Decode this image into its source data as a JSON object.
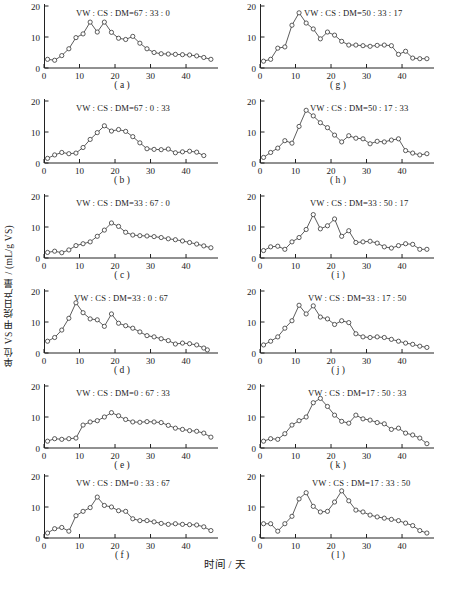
{
  "figure": {
    "ylabel": "单位 VS 甲烷日产量 / (mL/g VS)",
    "xlabel": "时间 / 天"
  },
  "chart_data": [
    {
      "type": "line",
      "panel": "a",
      "caption": "( a )",
      "title": "VW : CS : DM=67 : 33 : 0",
      "xlabel": "",
      "ylabel": "",
      "xlim": [
        0,
        49
      ],
      "ylim": [
        0,
        20
      ],
      "xticks": [
        0,
        10,
        20,
        30,
        40
      ],
      "yticks": [
        0,
        10,
        20
      ],
      "grid": false,
      "x": [
        1,
        3,
        5,
        7,
        9,
        11,
        13,
        15,
        17,
        19,
        21,
        23,
        25,
        27,
        29,
        31,
        33,
        35,
        37,
        39,
        41,
        43,
        45,
        47
      ],
      "values": [
        2.8,
        2.5,
        4.0,
        6.2,
        9.8,
        11.0,
        14.8,
        11.6,
        14.8,
        11.5,
        9.6,
        9.2,
        10.2,
        8.0,
        6.2,
        5.0,
        4.6,
        4.5,
        4.4,
        4.3,
        4.2,
        3.9,
        3.4,
        2.8
      ]
    },
    {
      "type": "line",
      "panel": "b",
      "caption": "( b )",
      "title": "VW : CS : DM=67 : 0 : 33",
      "xlim": [
        0,
        49
      ],
      "ylim": [
        0,
        20
      ],
      "xticks": [
        0,
        10,
        20,
        30,
        40
      ],
      "yticks": [
        0,
        10,
        20
      ],
      "grid": false,
      "x": [
        1,
        3,
        5,
        7,
        9,
        11,
        13,
        15,
        17,
        19,
        21,
        23,
        25,
        27,
        29,
        31,
        33,
        35,
        37,
        39,
        41,
        43,
        45
      ],
      "values": [
        1.5,
        2.6,
        3.4,
        3.0,
        3.2,
        5.0,
        7.6,
        9.8,
        12.0,
        10.3,
        10.8,
        10.2,
        8.5,
        6.5,
        4.6,
        4.4,
        4.3,
        4.5,
        3.3,
        3.6,
        3.8,
        3.5,
        2.4
      ]
    },
    {
      "type": "line",
      "panel": "c",
      "caption": "( c )",
      "title": "VW : CS : DM=33 : 67 : 0",
      "xlim": [
        0,
        49
      ],
      "ylim": [
        0,
        20
      ],
      "xticks": [
        0,
        10,
        20,
        30,
        40
      ],
      "yticks": [
        0,
        10,
        20
      ],
      "grid": false,
      "x": [
        1,
        3,
        5,
        7,
        9,
        11,
        13,
        15,
        17,
        19,
        21,
        23,
        25,
        27,
        29,
        31,
        33,
        35,
        37,
        39,
        41,
        43,
        45,
        47
      ],
      "values": [
        1.8,
        2.2,
        1.7,
        2.6,
        4.0,
        4.6,
        5.2,
        7.0,
        9.0,
        11.3,
        10.2,
        8.3,
        7.4,
        7.2,
        7.1,
        6.9,
        6.6,
        6.2,
        5.9,
        5.5,
        5.0,
        4.5,
        3.9,
        3.3
      ]
    },
    {
      "type": "line",
      "panel": "d",
      "caption": "( d )",
      "title": "VW : CS : DM=33 : 0 : 67",
      "xlim": [
        0,
        49
      ],
      "ylim": [
        0,
        20
      ],
      "xticks": [
        0,
        10,
        20,
        30,
        40
      ],
      "yticks": [
        0,
        10,
        20
      ],
      "grid": false,
      "x": [
        1,
        3,
        5,
        7,
        9,
        11,
        13,
        15,
        17,
        19,
        21,
        23,
        25,
        27,
        29,
        31,
        33,
        35,
        37,
        39,
        41,
        43,
        45,
        46
      ],
      "values": [
        3.8,
        5.0,
        7.4,
        11.2,
        16.2,
        13.0,
        11.0,
        10.7,
        8.6,
        12.6,
        9.6,
        8.8,
        8.0,
        6.8,
        5.6,
        5.2,
        4.6,
        4.0,
        2.9,
        3.2,
        3.0,
        2.6,
        1.6,
        1.0
      ]
    },
    {
      "type": "line",
      "panel": "e",
      "caption": "( e )",
      "title": "VW : CS : DM=0 : 67 : 33",
      "xlim": [
        0,
        49
      ],
      "ylim": [
        0,
        20
      ],
      "xticks": [
        0,
        10,
        20,
        30,
        40
      ],
      "yticks": [
        0,
        10,
        20
      ],
      "grid": false,
      "x": [
        1,
        3,
        5,
        7,
        9,
        11,
        13,
        15,
        17,
        19,
        21,
        23,
        25,
        27,
        29,
        31,
        33,
        35,
        37,
        39,
        41,
        43,
        45,
        47
      ],
      "values": [
        2.2,
        3.0,
        2.8,
        3.0,
        3.2,
        7.4,
        8.4,
        8.8,
        10.0,
        11.4,
        10.4,
        9.2,
        8.4,
        8.3,
        8.5,
        8.4,
        8.2,
        7.3,
        6.4,
        6.0,
        5.6,
        5.4,
        4.8,
        3.5
      ]
    },
    {
      "type": "line",
      "panel": "f",
      "caption": "( f )",
      "title": "VW : CS : DM=0 : 33 : 67",
      "xlim": [
        0,
        49
      ],
      "ylim": [
        0,
        20
      ],
      "xticks": [
        0,
        10,
        20,
        30,
        40
      ],
      "yticks": [
        0,
        10,
        20
      ],
      "grid": false,
      "x": [
        1,
        3,
        5,
        7,
        9,
        11,
        13,
        15,
        17,
        19,
        21,
        23,
        25,
        27,
        29,
        31,
        33,
        35,
        37,
        39,
        41,
        43,
        45,
        47
      ],
      "values": [
        1.6,
        3.0,
        3.4,
        2.2,
        7.2,
        8.6,
        9.8,
        13.2,
        10.5,
        10.0,
        8.8,
        8.6,
        6.2,
        5.6,
        5.6,
        5.2,
        4.7,
        4.4,
        4.6,
        4.4,
        4.3,
        4.2,
        3.6,
        2.4
      ]
    },
    {
      "type": "line",
      "panel": "g",
      "caption": "( g )",
      "title": "VW : CS : DM=50 : 33 : 17",
      "xlim": [
        0,
        49
      ],
      "ylim": [
        0,
        20
      ],
      "xticks": [
        0,
        10,
        20,
        30,
        40
      ],
      "yticks": [
        0,
        10,
        20
      ],
      "grid": false,
      "x": [
        1,
        3,
        5,
        7,
        9,
        11,
        13,
        15,
        17,
        19,
        21,
        23,
        25,
        27,
        29,
        31,
        33,
        35,
        37,
        39,
        41,
        43,
        45,
        47
      ],
      "values": [
        2.2,
        2.8,
        6.4,
        6.8,
        13.8,
        17.8,
        14.5,
        12.6,
        9.4,
        11.6,
        10.6,
        8.6,
        7.4,
        7.4,
        7.2,
        7.0,
        7.3,
        7.4,
        7.2,
        4.4,
        5.4,
        3.2,
        3.0,
        3.0
      ]
    },
    {
      "type": "line",
      "panel": "h",
      "caption": "( h )",
      "title": "VW : CS : DM=50 : 17 : 33",
      "xlim": [
        0,
        49
      ],
      "ylim": [
        0,
        20
      ],
      "xticks": [
        0,
        10,
        20,
        30,
        40
      ],
      "yticks": [
        0,
        10,
        20
      ],
      "grid": false,
      "x": [
        1,
        3,
        5,
        7,
        9,
        11,
        13,
        15,
        17,
        19,
        21,
        23,
        25,
        27,
        29,
        31,
        33,
        35,
        37,
        39,
        41,
        43,
        45,
        47
      ],
      "values": [
        1.8,
        3.4,
        4.8,
        7.2,
        6.4,
        11.8,
        17.0,
        15.2,
        13.0,
        11.4,
        9.0,
        6.8,
        8.8,
        8.0,
        7.8,
        6.2,
        7.0,
        6.8,
        7.4,
        7.8,
        4.0,
        3.2,
        2.6,
        3.0
      ]
    },
    {
      "type": "line",
      "panel": "i",
      "caption": "( i )",
      "title": "VW : CS : DM=33 : 50 : 17",
      "xlim": [
        0,
        49
      ],
      "ylim": [
        0,
        20
      ],
      "xticks": [
        0,
        10,
        20,
        30,
        40
      ],
      "yticks": [
        0,
        10,
        20
      ],
      "grid": false,
      "x": [
        1,
        3,
        5,
        7,
        9,
        11,
        13,
        15,
        17,
        19,
        21,
        23,
        25,
        27,
        29,
        31,
        33,
        35,
        37,
        39,
        41,
        43,
        45,
        47
      ],
      "values": [
        2.4,
        3.6,
        3.8,
        2.8,
        5.2,
        6.6,
        9.2,
        14.0,
        9.4,
        10.4,
        12.6,
        7.0,
        8.8,
        5.0,
        5.2,
        5.4,
        4.8,
        3.6,
        3.2,
        4.0,
        4.6,
        4.4,
        2.8,
        2.8
      ]
    },
    {
      "type": "line",
      "panel": "j",
      "caption": "( j )",
      "title": "VW : CS : DM=33 : 17 : 50",
      "xlim": [
        0,
        49
      ],
      "ylim": [
        0,
        20
      ],
      "xticks": [
        0,
        10,
        20,
        30,
        40
      ],
      "yticks": [
        0,
        10,
        20
      ],
      "grid": false,
      "x": [
        1,
        3,
        5,
        7,
        9,
        11,
        13,
        15,
        17,
        19,
        21,
        23,
        25,
        27,
        29,
        31,
        33,
        35,
        37,
        39,
        41,
        43,
        45,
        47
      ],
      "values": [
        2.6,
        3.8,
        5.2,
        8.0,
        10.4,
        15.4,
        12.6,
        15.2,
        11.6,
        11.0,
        9.2,
        10.4,
        9.8,
        6.2,
        5.2,
        5.0,
        5.2,
        5.0,
        4.4,
        3.8,
        3.2,
        2.8,
        2.2,
        1.8
      ]
    },
    {
      "type": "line",
      "panel": "k",
      "caption": "( k )",
      "title": "VW : CS : DM=17 : 50 : 33",
      "xlim": [
        0,
        49
      ],
      "ylim": [
        0,
        20
      ],
      "xticks": [
        0,
        10,
        20,
        30,
        40
      ],
      "yticks": [
        0,
        10,
        20
      ],
      "grid": false,
      "x": [
        1,
        3,
        5,
        7,
        9,
        11,
        13,
        15,
        17,
        19,
        21,
        23,
        25,
        27,
        29,
        31,
        33,
        35,
        37,
        39,
        41,
        43,
        45,
        47
      ],
      "values": [
        2.2,
        3.0,
        2.8,
        4.6,
        7.4,
        8.8,
        10.0,
        14.6,
        16.0,
        13.4,
        10.6,
        8.6,
        8.0,
        10.6,
        9.4,
        9.0,
        8.2,
        7.8,
        6.0,
        6.4,
        4.8,
        4.2,
        3.2,
        1.4
      ]
    },
    {
      "type": "line",
      "panel": "l",
      "caption": "( l )",
      "title": "VW : CS : DM=17 : 33 : 50",
      "xlim": [
        0,
        49
      ],
      "ylim": [
        0,
        20
      ],
      "xticks": [
        0,
        10,
        20,
        30,
        40
      ],
      "yticks": [
        0,
        10,
        20
      ],
      "grid": false,
      "x": [
        1,
        3,
        5,
        7,
        9,
        11,
        13,
        15,
        17,
        19,
        21,
        23,
        25,
        27,
        29,
        31,
        33,
        35,
        37,
        39,
        41,
        43,
        45,
        47
      ],
      "values": [
        4.6,
        4.6,
        2.2,
        4.6,
        7.0,
        12.6,
        14.6,
        10.2,
        8.4,
        8.6,
        11.6,
        15.2,
        12.0,
        9.0,
        8.4,
        7.4,
        6.8,
        6.4,
        6.0,
        5.6,
        4.8,
        4.0,
        2.4,
        1.6
      ]
    }
  ]
}
